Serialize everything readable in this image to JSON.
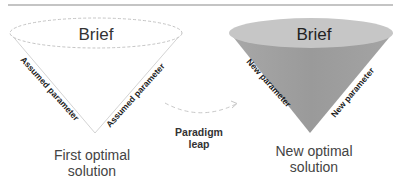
{
  "left_cone": {
    "top_label": "Brief",
    "left_edge_label": "Assumed parameter",
    "right_edge_label": "Assumed parameter",
    "caption_line1": "First optimal",
    "caption_line2": "solution"
  },
  "transition": {
    "label_line1": "Paradigm",
    "label_line2": "leap"
  },
  "right_cone": {
    "top_label": "Brief",
    "left_edge_label": "New parameter",
    "right_edge_label": "New parameter",
    "caption_line1": "New optimal",
    "caption_line2": "solution"
  },
  "colors": {
    "right_cone_fill": "#9d9d9d",
    "right_cone_top": "#c4c4c4",
    "rule": "#8a8a8a",
    "text": "#333333"
  }
}
